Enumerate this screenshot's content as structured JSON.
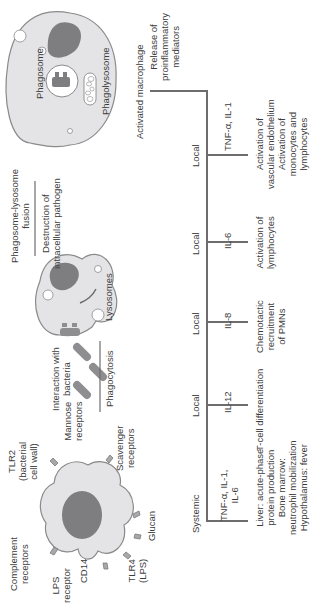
{
  "diagram": {
    "orientation": "rotated 90 degrees counterclockwise",
    "macrophage": {
      "receptors": [
        {
          "label": "Complement\nreceptors"
        },
        {
          "label": "TLR2\n(bacterial\ncell wall)"
        },
        {
          "label": "Mannose\nreceptors"
        },
        {
          "label": "Scavenger\nreceptors"
        },
        {
          "label": "Glucan"
        },
        {
          "label": "TLR4\n(LPS)"
        },
        {
          "label": "CD14"
        },
        {
          "label": "LPS\nreceptor"
        }
      ]
    },
    "steps": {
      "interaction": "Interaction with\nbacteria",
      "phagocytosis": "Phagocytosis",
      "lysosomes": "Lysosomes",
      "fusion": "Phagosome-lysosome\nfusion",
      "destruction": "Destruction of\nintracellular pathogen",
      "phagosome": "Phagosome",
      "phagolysosome": "Phagolysosome",
      "activated": "Activated macrophage",
      "release": "Release of\nproinflammatory\nmediators"
    },
    "branches": [
      {
        "scope": "Systemic",
        "mediator": "TNF-α, IL-1,\nIL-6",
        "effect": "Liver: acute-phase\nprotein production\nBone marrow:\nneutrophil mobilization\nHypothalamus: fever"
      },
      {
        "scope": "Local",
        "mediator": "IL-12",
        "effect": "T-cell differentiation"
      },
      {
        "scope": "Local",
        "mediator": "IL-8",
        "effect": "Chemotactic\nrecruitment\nof PMNs"
      },
      {
        "scope": "Local",
        "mediator": "IL-6",
        "effect": "Activation of\nlymphocytes"
      },
      {
        "scope": "Local",
        "mediator": "TNF-α, IL-1",
        "effect": "Activation of\nvascular endothelium\nActivation of\nmonocytes and\nlymphocytes"
      }
    ],
    "colors": {
      "line": "#6d6d6d",
      "cell_fill": "#e4e4e6",
      "cell_stroke": "#8a8a8a",
      "nucleus": "#7e7e80",
      "text": "#3c3c3c"
    }
  }
}
